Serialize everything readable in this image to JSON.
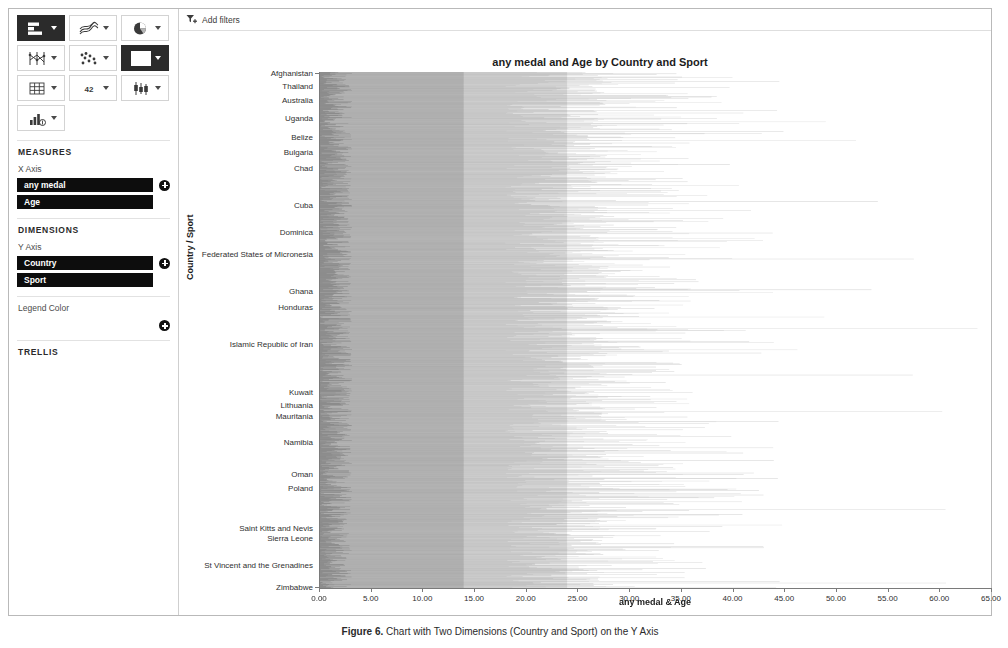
{
  "toolbar": {
    "buttons": [
      {
        "name": "bar-chart",
        "glyph": "bar",
        "selected": true
      },
      {
        "name": "line-chart",
        "glyph": "line",
        "selected": false
      },
      {
        "name": "pie-chart",
        "glyph": "pie",
        "selected": false
      },
      {
        "name": "parallel-coordinates-chart",
        "glyph": "parallel",
        "selected": false
      },
      {
        "name": "scatter-plot",
        "glyph": "scatter",
        "selected": false
      },
      {
        "name": "heatmap-chart",
        "glyph": "heatmap",
        "selected": true
      },
      {
        "name": "table-view",
        "glyph": "grid",
        "selected": false
      },
      {
        "name": "kpi-number-view",
        "glyph": "42",
        "selected": false
      },
      {
        "name": "box-plot",
        "glyph": "box",
        "selected": false
      },
      {
        "name": "combination-chart",
        "glyph": "combo",
        "selected": false
      }
    ],
    "kpi_label": "42"
  },
  "panel": {
    "measures_title": "MEASURES",
    "x_axis_label": "X Axis",
    "x_axis_pills": [
      "any medal",
      "Age"
    ],
    "dimensions_title": "DIMENSIONS",
    "y_axis_label": "Y Axis",
    "y_axis_pills": [
      "Country",
      "Sport"
    ],
    "legend_color_label": "Legend Color",
    "trellis_title": "TRELLIS"
  },
  "filterbar": {
    "add_filters_label": "Add filters"
  },
  "legend": {
    "title": "All Measures",
    "items": [
      {
        "label": "any medal",
        "color": "#6e6e6e"
      },
      {
        "label": "Age",
        "color": "#c8c8c8"
      }
    ]
  },
  "caption": {
    "prefix": "Figure",
    "number": "6.",
    "text": "Chart with Two Dimensions (Country and Sport) on the Y Axis"
  },
  "chart_data": {
    "type": "bar",
    "orientation": "horizontal",
    "title": "any medal and Age by Country and Sport",
    "xlabel": "any medal & Age",
    "ylabel": "Country / Sport",
    "xlim": [
      0,
      65
    ],
    "xticks": [
      "0.00",
      "5.00",
      "10.00",
      "15.00",
      "20.00",
      "25.00",
      "30.00",
      "35.00",
      "40.00",
      "45.00",
      "50.00",
      "55.00",
      "60.00",
      "65.00"
    ],
    "grid": false,
    "legend_position": "right",
    "series": [
      {
        "name": "any medal",
        "color": "#6e6e6e"
      },
      {
        "name": "Age",
        "color": "#c8c8c8"
      }
    ],
    "note": "Very dense chart: thousands of thin horizontal bar pairs, one pair per Country/Sport combination. Only a subset of Country values are labelled on the Y axis.",
    "category_labels": [
      {
        "label": "Afghanistan",
        "pos": 0.002
      },
      {
        "label": "Australia",
        "pos": 0.055
      },
      {
        "label": "Belize",
        "pos": 0.125
      },
      {
        "label": "Bulgaria",
        "pos": 0.156
      },
      {
        "label": "Chad",
        "pos": 0.187
      },
      {
        "label": "Cuba",
        "pos": 0.258
      },
      {
        "label": "Dominica",
        "pos": 0.31
      },
      {
        "label": "Federated States of Micronesia",
        "pos": 0.352
      },
      {
        "label": "Ghana",
        "pos": 0.424
      },
      {
        "label": "Honduras",
        "pos": 0.455
      },
      {
        "label": "Islamic Republic of Iran",
        "pos": 0.527
      },
      {
        "label": "Kuwait",
        "pos": 0.62
      },
      {
        "label": "Lithuania",
        "pos": 0.646
      },
      {
        "label": "Mauritania",
        "pos": 0.667
      },
      {
        "label": "Namibia",
        "pos": 0.718
      },
      {
        "label": "Oman",
        "pos": 0.78
      },
      {
        "label": "Poland",
        "pos": 0.806
      },
      {
        "label": "Saint Kitts and Nevis",
        "pos": 0.883
      },
      {
        "label": "Sierra Leone",
        "pos": 0.904
      },
      {
        "label": "St Vincent and the Grenadines",
        "pos": 0.955
      },
      {
        "label": "Thailand",
        "pos": 0.027
      },
      {
        "label": "Uganda",
        "pos": 0.09
      }
    ],
    "y_labels_ordered": [
      "Afghanistan",
      "Australia",
      "Belize",
      "Bulgaria",
      "Chad",
      "Cuba",
      "Dominica",
      "Federated States of Micronesia",
      "Ghana",
      "Honduras",
      "Islamic Republic of Iran",
      "Kuwait",
      "Lithuania",
      "Mauritania",
      "Namibia",
      "Oman",
      "Poland",
      "Saint Kitts and Nevis",
      "Sierra Leone",
      "St Vincent and the Grenadines",
      "Thailand",
      "Uganda",
      "Zimbabwe"
    ],
    "y_label_positions": [
      0.002,
      0.055,
      0.125,
      0.156,
      0.187,
      0.258,
      0.31,
      0.352,
      0.424,
      0.455,
      0.527,
      0.62,
      0.646,
      0.667,
      0.718,
      0.78,
      0.806,
      0.883,
      0.904,
      0.955,
      0.027,
      0.09,
      0.999
    ]
  }
}
